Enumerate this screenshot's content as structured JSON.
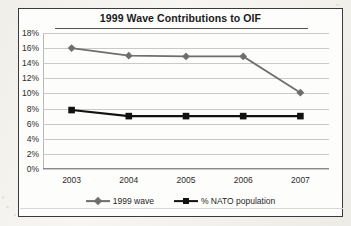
{
  "chart_data": {
    "type": "line",
    "title": "1999 Wave Contributions to OIF",
    "xlabel": "",
    "ylabel": "",
    "categories": [
      "2003",
      "2004",
      "2005",
      "2006",
      "2007"
    ],
    "x": [
      2003,
      2004,
      2005,
      2006,
      2007
    ],
    "ylim": [
      0,
      18
    ],
    "yticks": [
      "0%",
      "2%",
      "4%",
      "6%",
      "8%",
      "10%",
      "12%",
      "14%",
      "16%",
      "18%"
    ],
    "ytick_values": [
      0,
      2,
      4,
      6,
      8,
      10,
      12,
      14,
      16,
      18
    ],
    "ytick_suffix": "%",
    "grid": true,
    "legend_position": "bottom",
    "series": [
      {
        "name": "1999 wave",
        "values": [
          16.0,
          15.0,
          14.9,
          14.9,
          10.1
        ],
        "color": "#6e6e6e",
        "marker": "diamond"
      },
      {
        "name": "% NATO population",
        "values": [
          7.8,
          7.0,
          7.0,
          7.0,
          7.0
        ],
        "color": "#111111",
        "marker": "square"
      }
    ]
  },
  "legend": {
    "entries": [
      {
        "label": "1999 wave",
        "marker": "diamond-marker",
        "color": "#6e6e6e"
      },
      {
        "label": "% NATO population",
        "marker": "square-marker",
        "color": "#111111"
      }
    ]
  }
}
